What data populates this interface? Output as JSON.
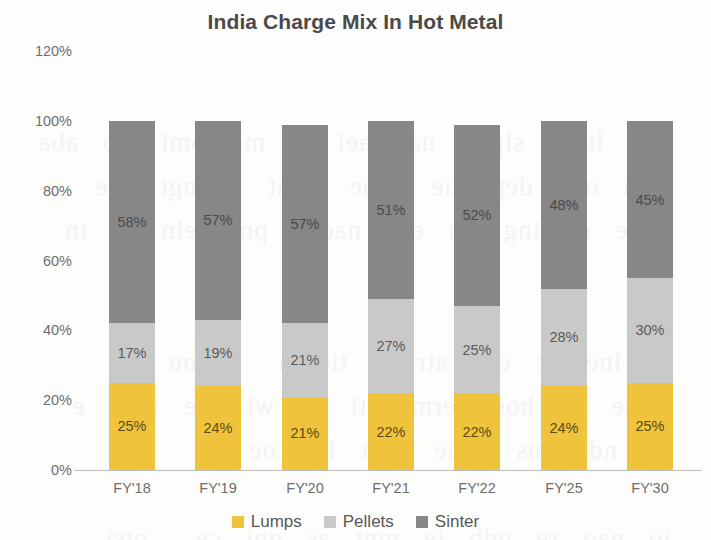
{
  "chart_data": {
    "type": "bar",
    "subtype": "stacked-column-100",
    "title": "India Charge Mix In Hot Metal",
    "xlabel": "",
    "ylabel": "",
    "ylim": [
      0,
      120
    ],
    "ytick_values": [
      0,
      20,
      40,
      60,
      80,
      100,
      120
    ],
    "ytick_labels": [
      "0%",
      "20%",
      "40%",
      "60%",
      "80%",
      "100%",
      "120%"
    ],
    "grid": false,
    "legend_position": "bottom",
    "categories": [
      "FY'18",
      "FY'19",
      "FY'20",
      "FY'21",
      "FY'22",
      "FY'25",
      "FY'30"
    ],
    "series": [
      {
        "name": "Lumps",
        "color": "#f0c33c",
        "values": [
          25,
          24,
          21,
          22,
          22,
          24,
          25
        ],
        "labels": [
          "25%",
          "24%",
          "21%",
          "22%",
          "22%",
          "24%",
          "25%"
        ]
      },
      {
        "name": "Pellets",
        "color": "#c9c9c9",
        "values": [
          17,
          19,
          21,
          27,
          25,
          28,
          30
        ],
        "labels": [
          "17%",
          "19%",
          "21%",
          "27%",
          "25%",
          "28%",
          "30%"
        ]
      },
      {
        "name": "Sinter",
        "color": "#878787",
        "values": [
          58,
          57,
          57,
          51,
          52,
          48,
          45
        ],
        "labels": [
          "58%",
          "57%",
          "57%",
          "51%",
          "52%",
          "48%",
          "45%"
        ]
      }
    ]
  },
  "legend": {
    "items": [
      {
        "label": "Lumps",
        "color": "#f0c33c"
      },
      {
        "label": "Pellets",
        "color": "#c9c9c9"
      },
      {
        "label": "Sinter",
        "color": "#878787"
      }
    ]
  },
  "background_bleed_text": "scanned page bleed-through"
}
